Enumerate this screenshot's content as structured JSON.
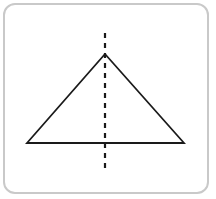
{
  "canvas": {
    "width": 216,
    "height": 199,
    "background_color": "#ffffff"
  },
  "card": {
    "name": "diagram-card",
    "x": 3,
    "y": 3,
    "width": 206,
    "height": 191,
    "corner_radius": 12,
    "border_color": "#c9c9c9",
    "border_width": 2,
    "fill_color": "#ffffff"
  },
  "figure": {
    "title": "Isosceles triangle with vertical line of symmetry",
    "stroke_color": "#1a1a1a",
    "triangle": {
      "name": "isosceles-triangle",
      "solid": true,
      "stroke_width": 1.8,
      "fill": "none",
      "vertices": [
        {
          "label": "apex",
          "x": 105,
          "y": 54
        },
        {
          "label": "base-left",
          "x": 27,
          "y": 143
        },
        {
          "label": "base-right",
          "x": 184,
          "y": 143
        }
      ]
    },
    "symmetry_line": {
      "name": "line-of-symmetry",
      "style": "dashed",
      "stroke_width": 2.2,
      "dash_length": 5,
      "gap_length": 5,
      "x": 105,
      "y_start": 33,
      "y_end": 172
    }
  }
}
